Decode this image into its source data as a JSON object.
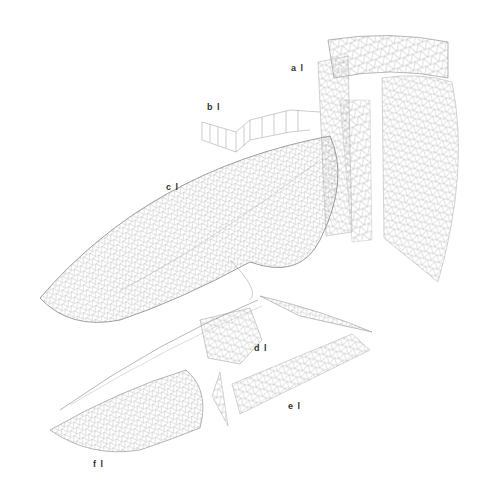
{
  "diagram": {
    "type": "exploded axonometric wireframe of triangulated mesh surfaces",
    "background": "#ffffff",
    "line_color": "#9a9a9a",
    "labels": [
      {
        "id": "a",
        "text": "a l",
        "x": 291,
        "y": 63
      },
      {
        "id": "b",
        "text": "b l",
        "x": 207,
        "y": 102
      },
      {
        "id": "c",
        "text": "c l",
        "x": 166,
        "y": 182
      },
      {
        "id": "d",
        "text": "d l",
        "x": 254,
        "y": 343
      },
      {
        "id": "e",
        "text": "e l",
        "x": 288,
        "y": 401
      },
      {
        "id": "f",
        "text": "f l",
        "x": 93,
        "y": 459
      }
    ]
  }
}
